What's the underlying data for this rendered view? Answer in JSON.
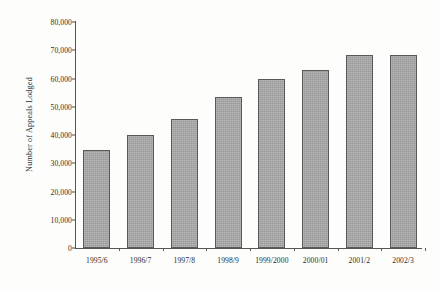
{
  "chart_data": {
    "type": "bar",
    "title": "",
    "xlabel": "",
    "ylabel": "Number of Appeals Lodged",
    "categories": [
      "1995/6",
      "1996/7",
      "1997/8",
      "1998/9",
      "1999/2000",
      "2000/01",
      "2001/2",
      "2002/3"
    ],
    "values": [
      34800,
      40000,
      45600,
      53400,
      60000,
      63000,
      68500,
      68200
    ],
    "ylim": [
      0,
      80000
    ],
    "ytick_values": [
      0,
      10000,
      20000,
      30000,
      40000,
      50000,
      60000,
      70000,
      80000
    ],
    "ytick_labels": [
      "0",
      "10,000",
      "20,000",
      "30,000",
      "40,000",
      "50,000",
      "60,000",
      "70,000",
      "80,000"
    ],
    "grid": false,
    "legend": null,
    "legend_position": "none",
    "bar_fill_color": "#a6a6a6",
    "bar_border_color": "#595959",
    "axis_color": "#555555",
    "background_color": "#fdfdfc",
    "text_color": "#2b2b2b"
  }
}
